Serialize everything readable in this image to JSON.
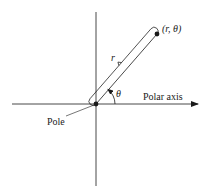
{
  "diagram": {
    "type": "polar-coordinate-system",
    "colors": {
      "line": "#1a1a1a",
      "background": "#ffffff"
    },
    "labels": {
      "point": "(r, θ)",
      "radius": "r",
      "angle": "θ",
      "axis": "Polar axis",
      "origin": "Pole"
    }
  }
}
